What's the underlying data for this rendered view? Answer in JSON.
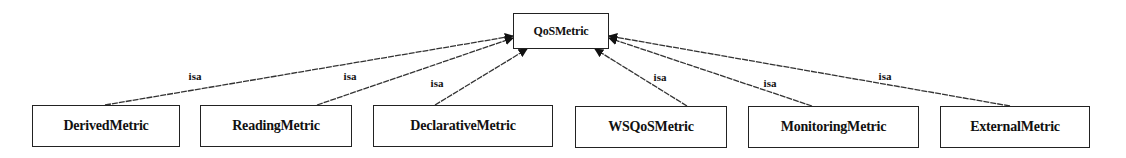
{
  "diagram": {
    "type": "class-hierarchy",
    "root": {
      "id": "qosmetric",
      "label": "QoSMetric",
      "x": 513,
      "y": 13,
      "w": 96,
      "h": 36
    },
    "children": [
      {
        "id": "derivedmetric",
        "label": "DerivedMetric",
        "x": 32,
        "y": 105,
        "w": 148,
        "h": 42,
        "edge_from": [
          105,
          105
        ],
        "edge_to": [
          513,
          36
        ],
        "isa_pos": [
          195,
          76
        ]
      },
      {
        "id": "readingmetric",
        "label": "ReadingMetric",
        "x": 200,
        "y": 105,
        "w": 152,
        "h": 42,
        "edge_from": [
          317,
          105
        ],
        "edge_to": [
          513,
          38
        ],
        "isa_pos": [
          350,
          76
        ]
      },
      {
        "id": "declarativemetric",
        "label": "DeclarativeMetric",
        "x": 373,
        "y": 105,
        "w": 180,
        "h": 42,
        "edge_from": [
          435,
          105
        ],
        "edge_to": [
          527,
          49
        ],
        "isa_pos": [
          437,
          83
        ]
      },
      {
        "id": "wsqosmetric",
        "label": "WSQoSMetric",
        "x": 575,
        "y": 106,
        "w": 152,
        "h": 42,
        "edge_from": [
          687,
          106
        ],
        "edge_to": [
          595,
          49
        ],
        "isa_pos": [
          660,
          77
        ]
      },
      {
        "id": "monitoringmetric",
        "label": "MonitoringMetric",
        "x": 748,
        "y": 106,
        "w": 171,
        "h": 42,
        "edge_from": [
          812,
          106
        ],
        "edge_to": [
          609,
          38
        ],
        "isa_pos": [
          770,
          83
        ]
      },
      {
        "id": "externalmetric",
        "label": "ExternalMetric",
        "x": 940,
        "y": 106,
        "w": 150,
        "h": 42,
        "edge_from": [
          1010,
          106
        ],
        "edge_to": [
          609,
          36
        ],
        "isa_pos": [
          885,
          76
        ]
      }
    ],
    "edge_label": "isa",
    "colors": {
      "line": "#333333",
      "box_border": "#222222",
      "text": "#111111",
      "background": "#ffffff"
    }
  }
}
